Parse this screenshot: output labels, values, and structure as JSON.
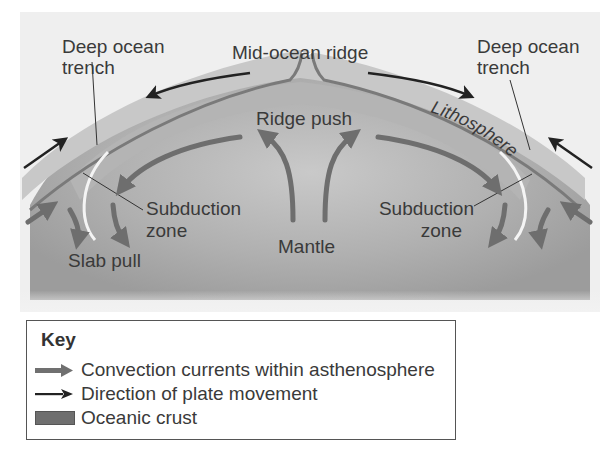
{
  "diagram": {
    "labels": {
      "mid_ocean_ridge": "Mid-ocean ridge",
      "deep_ocean_trench_left_line1": "Deep ocean",
      "deep_ocean_trench_left_line2": "trench",
      "deep_ocean_trench_right_line1": "Deep ocean",
      "deep_ocean_trench_right_line2": "trench",
      "ridge_push": "Ridge push",
      "lithosphere": "Lithosphere",
      "subduction_zone_left_line1": "Subduction",
      "subduction_zone_left_line2": "zone",
      "subduction_zone_right_line1": "Subduction",
      "subduction_zone_right_line2": "zone",
      "mantle": "Mantle",
      "slab_pull": "Slab pull"
    },
    "colors": {
      "background": "#f0f0f0",
      "lithosphere": "#bdbdbd",
      "mantle": "#a8a8a8",
      "convection_arrow": "#707070",
      "plate_arrow": "#222222",
      "crust_line": "#7a7a7a"
    }
  },
  "key": {
    "title": "Key",
    "items": [
      {
        "icon": "convection-arrow",
        "label": "Convection currents within asthenosphere"
      },
      {
        "icon": "plate-movement-arrow",
        "label": "Direction of plate movement"
      },
      {
        "icon": "oceanic-crust-swatch",
        "label": "Oceanic crust"
      }
    ]
  }
}
